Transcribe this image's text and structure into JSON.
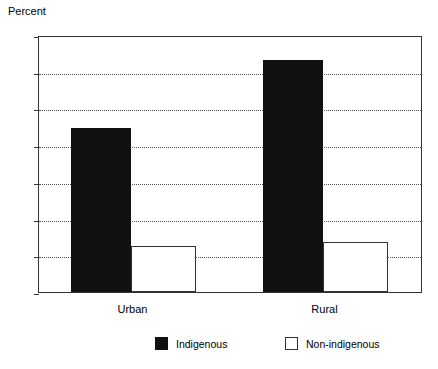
{
  "chart_data": {
    "type": "bar",
    "title": "",
    "xlabel": "",
    "ylabel": "Percent",
    "ylim": [
      0,
      70
    ],
    "yticks": [
      0,
      10,
      20,
      30,
      40,
      50,
      60,
      70
    ],
    "grid": true,
    "legend_position": "bottom",
    "categories": [
      "Urban",
      "Rural"
    ],
    "series": [
      {
        "name": "Indigenous",
        "color": "#111111",
        "style": "filled",
        "values": [
          44.8,
          63.3
        ]
      },
      {
        "name": "Non-indigenous",
        "color": "#ffffff",
        "style": "hollow",
        "values": [
          12.5,
          13.5
        ]
      }
    ]
  },
  "axis": {
    "y_title": "Percent",
    "tick_labels": [
      "70",
      "60",
      "50",
      "40",
      "30",
      "20",
      "10",
      "0"
    ],
    "category_labels": [
      "Urban",
      "Rural"
    ]
  },
  "legend": {
    "items": [
      {
        "label": "Indigenous",
        "swatch": "filled-square-icon"
      },
      {
        "label": "Non-indigenous",
        "swatch": "hollow-square-icon"
      }
    ]
  }
}
